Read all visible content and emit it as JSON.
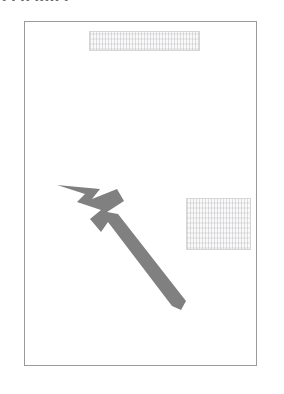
{
  "document": {
    "clipped_header_text": "• • •• ••••• •",
    "page_title": "document-page",
    "background_color": "#ffffff",
    "page_border_color": "#9a9a9e"
  },
  "redacted_blocks": [
    {
      "name": "top-redacted-text-block",
      "label": "",
      "content": "",
      "border_color": "#d6d6d8",
      "fill_color": "#fafafa"
    },
    {
      "name": "right-redacted-text-block",
      "label": "",
      "content": "",
      "border_color": "#d6d6d8",
      "fill_color": "#fafafa"
    }
  ],
  "annotation": {
    "type": "arrow",
    "direction": "up-left",
    "color": "#808080",
    "tip": {
      "x": 57,
      "y": 185
    },
    "tail": {
      "x": 185,
      "y": 305
    },
    "label": ""
  }
}
